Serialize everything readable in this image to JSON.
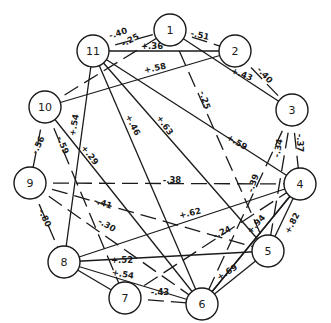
{
  "diagram": {
    "type": "correlation-network",
    "nodes": [
      {
        "id": "1",
        "label": "1",
        "x": 170,
        "y": 30
      },
      {
        "id": "2",
        "label": "2",
        "x": 235,
        "y": 51
      },
      {
        "id": "3",
        "label": "3",
        "x": 292,
        "y": 110
      },
      {
        "id": "4",
        "label": "4",
        "x": 300,
        "y": 184
      },
      {
        "id": "5",
        "label": "5",
        "x": 268,
        "y": 251
      },
      {
        "id": "6",
        "label": "6",
        "x": 202,
        "y": 304
      },
      {
        "id": "7",
        "label": "7",
        "x": 125,
        "y": 298
      },
      {
        "id": "8",
        "label": "8",
        "x": 64,
        "y": 262
      },
      {
        "id": "9",
        "label": "9",
        "x": 30,
        "y": 183
      },
      {
        "id": "10",
        "label": "10",
        "x": 45,
        "y": 107
      },
      {
        "id": "11",
        "label": "11",
        "x": 93,
        "y": 51
      }
    ],
    "edges": [
      {
        "from": "11",
        "to": "1",
        "value": "-.40",
        "sign": "negative",
        "lx": 118,
        "ly": 33,
        "angle": -18
      },
      {
        "from": "10",
        "to": "1",
        "value": "-.25",
        "sign": "negative",
        "lx": 130,
        "ly": 40,
        "angle": -28
      },
      {
        "from": "11",
        "to": "2",
        "value": "+.36",
        "sign": "positive",
        "lx": 152,
        "ly": 46,
        "angle": 0
      },
      {
        "from": "1",
        "to": "2",
        "value": "-.51",
        "sign": "negative",
        "lx": 200,
        "ly": 35,
        "angle": 12
      },
      {
        "from": "1",
        "to": "3",
        "value": "+.43",
        "sign": "positive",
        "lx": 242,
        "ly": 74,
        "angle": 22
      },
      {
        "from": "2",
        "to": "3",
        "value": "-.40",
        "sign": "negative",
        "lx": 265,
        "ly": 75,
        "angle": 48
      },
      {
        "from": "10",
        "to": "2",
        "value": "+.58",
        "sign": "positive",
        "lx": 155,
        "ly": 68,
        "angle": -12
      },
      {
        "from": "1",
        "to": "5",
        "value": "-.25",
        "sign": "negative",
        "lx": 205,
        "ly": 100,
        "angle": 72
      },
      {
        "from": "11",
        "to": "4",
        "value": "+.59",
        "sign": "positive",
        "lx": 237,
        "ly": 142,
        "angle": 30
      },
      {
        "from": "3",
        "to": "4",
        "value": "-.37",
        "sign": "negative",
        "lx": 300,
        "ly": 143,
        "angle": 90
      },
      {
        "from": "3",
        "to": "5",
        "value": "-.34",
        "sign": "negative",
        "lx": 278,
        "ly": 148,
        "angle": -80
      },
      {
        "from": "3",
        "to": "6",
        "value": "-.39",
        "sign": "negative",
        "lx": 253,
        "ly": 183,
        "angle": -72
      },
      {
        "from": "11",
        "to": "6",
        "value": "+.46",
        "sign": "positive",
        "lx": 133,
        "ly": 125,
        "angle": 62
      },
      {
        "from": "11",
        "to": "5",
        "value": "+.63",
        "sign": "positive",
        "lx": 165,
        "ly": 125,
        "angle": 55
      },
      {
        "from": "11",
        "to": "8",
        "value": "+.54",
        "sign": "positive",
        "lx": 74,
        "ly": 125,
        "angle": -80
      },
      {
        "from": "10",
        "to": "9",
        "value": "-.56",
        "sign": "negative",
        "lx": 38,
        "ly": 145,
        "angle": -65
      },
      {
        "from": "10",
        "to": "7",
        "value": "-.59",
        "sign": "negative",
        "lx": 63,
        "ly": 145,
        "angle": 68
      },
      {
        "from": "10",
        "to": "6",
        "value": "+.29",
        "sign": "positive",
        "lx": 90,
        "ly": 155,
        "angle": 52
      },
      {
        "from": "9",
        "to": "4",
        "value": "-.38",
        "sign": "negative",
        "lx": 172,
        "ly": 180,
        "angle": 0
      },
      {
        "from": "9",
        "to": "5",
        "value": "-.41",
        "sign": "negative",
        "lx": 103,
        "ly": 203,
        "angle": 18
      },
      {
        "from": "9",
        "to": "6",
        "value": "-.30",
        "sign": "negative",
        "lx": 107,
        "ly": 225,
        "angle": 30
      },
      {
        "from": "9",
        "to": "8",
        "value": "-.80",
        "sign": "negative",
        "lx": 45,
        "ly": 218,
        "angle": 65
      },
      {
        "from": "8",
        "to": "4",
        "value": "+.62",
        "sign": "positive",
        "lx": 190,
        "ly": 213,
        "angle": -14
      },
      {
        "from": "7",
        "to": "4",
        "value": "-.24",
        "sign": "negative",
        "lx": 222,
        "ly": 232,
        "angle": -25
      },
      {
        "from": "6",
        "to": "4",
        "value": "+.94",
        "sign": "positive",
        "lx": 256,
        "ly": 224,
        "angle": -48
      },
      {
        "from": "5",
        "to": "4",
        "value": "+.82",
        "sign": "positive",
        "lx": 292,
        "ly": 223,
        "angle": -62
      },
      {
        "from": "8",
        "to": "5",
        "value": "+.52",
        "sign": "positive",
        "lx": 122,
        "ly": 260,
        "angle": 0
      },
      {
        "from": "8",
        "to": "6",
        "value": "+.54",
        "sign": "positive",
        "lx": 123,
        "ly": 274,
        "angle": 10
      },
      {
        "from": "6",
        "to": "5",
        "value": "+.69",
        "sign": "positive",
        "lx": 227,
        "ly": 272,
        "angle": -32
      },
      {
        "from": "7",
        "to": "6",
        "value": "-.43",
        "sign": "negative",
        "lx": 160,
        "ly": 292,
        "angle": 0
      },
      {
        "from": "4",
        "to": "6",
        "value": "",
        "sign": "positive",
        "lx": 0,
        "ly": 0,
        "angle": 0
      },
      {
        "from": "8",
        "to": "7",
        "value": "",
        "sign": "positive",
        "lx": 0,
        "ly": 0,
        "angle": 0
      }
    ]
  },
  "colors": {
    "line": "#1a1a1a",
    "background": "#ffffff"
  }
}
